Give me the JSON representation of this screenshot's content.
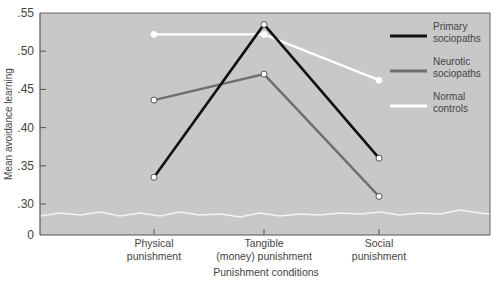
{
  "chart_data": {
    "type": "line",
    "title": "",
    "xlabel": "Punishment conditions",
    "ylabel": "Mean avoidance learning",
    "categories": [
      [
        "Physical",
        "punishment"
      ],
      [
        "Tangible",
        "(money) punishment"
      ],
      [
        "Social",
        "punishment"
      ]
    ],
    "yticks": [
      ".55",
      ".50",
      ".45",
      ".40",
      ".35",
      ".30",
      "0"
    ],
    "ylim": [
      0.25,
      0.55
    ],
    "axis_break": true,
    "grid": false,
    "legend_position": "upper right",
    "series": [
      {
        "name": "Primary sociopaths",
        "label_lines": [
          "Primary",
          "sociopaths"
        ],
        "color": "#111111",
        "values": [
          0.335,
          0.535,
          0.36
        ]
      },
      {
        "name": "Neurotic sociopaths",
        "label_lines": [
          "Neurotic",
          "sociopaths"
        ],
        "color": "#6e6e6e",
        "values": [
          0.436,
          0.47,
          0.31
        ]
      },
      {
        "name": "Normal controls",
        "label_lines": [
          "Normal",
          "controls"
        ],
        "color": "#ffffff",
        "values": [
          0.522,
          0.522,
          0.462
        ]
      }
    ],
    "colors": {
      "plot_background": "#c8c8c8",
      "axis": "#555555"
    }
  }
}
